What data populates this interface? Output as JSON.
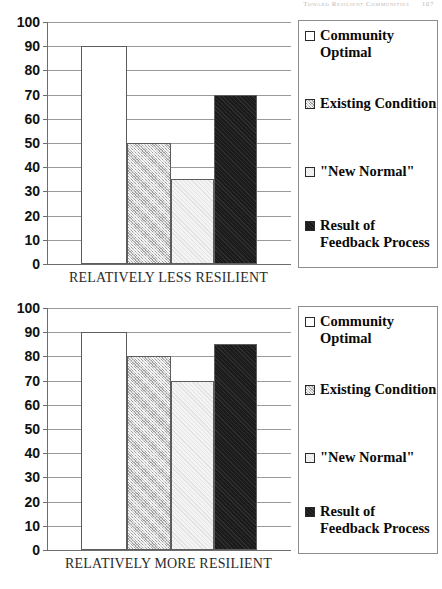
{
  "running_head": {
    "title": "Toward Resilient Communities",
    "page_number": "107"
  },
  "legend": {
    "items": [
      {
        "label": "Community Optimal",
        "swatch": "white-square-icon",
        "color": "#ffffff"
      },
      {
        "label": "Existing Condition",
        "swatch": "gray-hatch-square-icon",
        "color": "#c9c9c9"
      },
      {
        "label": "\"New Normal\"",
        "swatch": "light-square-icon",
        "color": "#f4f4f4"
      },
      {
        "label": "Result of Feedback Process",
        "swatch": "black-square-icon",
        "color": "#1b1b1b"
      }
    ]
  },
  "axis": {
    "ticks": [
      "100",
      "90",
      "80",
      "70",
      "60",
      "50",
      "40",
      "30",
      "20",
      "10",
      "0"
    ]
  },
  "chart_data": [
    {
      "type": "bar",
      "title": "",
      "xlabel": "RELATIVELY LESS RESILIENT",
      "ylabel": "",
      "ylim": [
        0,
        100
      ],
      "grid": true,
      "legend_position": "right",
      "categories": [
        "Community Optimal",
        "Existing Condition",
        "\"New Normal\"",
        "Result of Feedback Process"
      ],
      "values": [
        90,
        50,
        35,
        70
      ],
      "tick_labels": [
        "0",
        "10",
        "20",
        "30",
        "40",
        "50",
        "60",
        "70",
        "80",
        "90",
        "100"
      ]
    },
    {
      "type": "bar",
      "title": "",
      "xlabel": "RELATIVELY MORE RESILIENT",
      "ylabel": "",
      "ylim": [
        0,
        100
      ],
      "grid": true,
      "legend_position": "right",
      "categories": [
        "Community Optimal",
        "Existing Condition",
        "\"New Normal\"",
        "Result of Feedback Process"
      ],
      "values": [
        90,
        80,
        70,
        85
      ],
      "tick_labels": [
        "0",
        "10",
        "20",
        "30",
        "40",
        "50",
        "60",
        "70",
        "80",
        "90",
        "100"
      ]
    }
  ]
}
